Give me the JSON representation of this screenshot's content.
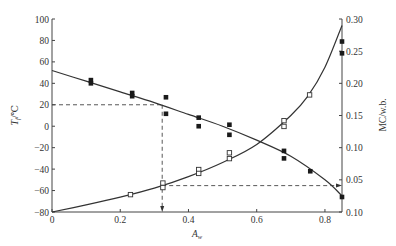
{
  "chart_data": {
    "type": "scatter",
    "title": "",
    "xlabel": "A_w",
    "ylabel_left": "T_f/℃",
    "ylabel_right": "MC/w.b.",
    "xlim": [
      0,
      0.85
    ],
    "ylim_left": [
      -80,
      100
    ],
    "ylim_right": [
      0.0,
      0.3
    ],
    "x_ticks": [
      "0",
      "0.2",
      "0.4",
      "0.6",
      "0.8"
    ],
    "x_tick_values": [
      0,
      0.2,
      0.4,
      0.6,
      0.8
    ],
    "y_left_ticks": [
      "100",
      "80",
      "60",
      "40",
      "20",
      "0",
      "-20",
      "-40",
      "-60",
      "-80"
    ],
    "y_left_tick_values": [
      100,
      80,
      60,
      40,
      20,
      0,
      -20,
      -40,
      -60,
      -80
    ],
    "y_right_ticks": [
      "0.30",
      "0.25",
      "0.20",
      "0.15",
      "0.10",
      "0.05",
      "0.10"
    ],
    "y_right_tick_values": [
      0.3,
      0.25,
      0.2,
      0.15,
      0.1,
      0.05,
      0.0
    ],
    "grid": false,
    "legend": null,
    "series": [
      {
        "name": "T_f (freezing point, filled squares)",
        "axis": "left",
        "marker": "filled-square",
        "points": [
          [
            0.114,
            43
          ],
          [
            0.114,
            40
          ],
          [
            0.235,
            31
          ],
          [
            0.235,
            28
          ],
          [
            0.334,
            27
          ],
          [
            0.334,
            11.6
          ],
          [
            0.43,
            8
          ],
          [
            0.43,
            0
          ],
          [
            0.52,
            1.4
          ],
          [
            0.52,
            -8
          ],
          [
            0.68,
            -23
          ],
          [
            0.68,
            -30
          ],
          [
            0.757,
            -42
          ],
          [
            0.85,
            -66
          ],
          [
            0.85,
            79
          ],
          [
            0.85,
            68
          ]
        ]
      },
      {
        "name": "MC (moisture content, open squares)",
        "axis": "right",
        "marker": "open-square",
        "points": [
          [
            0.23,
            0.027
          ],
          [
            0.325,
            0.045
          ],
          [
            0.325,
            0.038
          ],
          [
            0.43,
            0.066
          ],
          [
            0.43,
            0.06
          ],
          [
            0.52,
            0.092
          ],
          [
            0.52,
            0.083
          ],
          [
            0.68,
            0.142
          ],
          [
            0.68,
            0.133
          ],
          [
            0.755,
            0.182
          ]
        ]
      },
      {
        "name": "T_f fit curve",
        "axis": "left",
        "type": "line",
        "x": [
          0,
          0.1,
          0.2,
          0.3,
          0.4,
          0.5,
          0.6,
          0.7,
          0.8,
          0.85
        ],
        "values": [
          52,
          42,
          32,
          22,
          11,
          0,
          -13,
          -28,
          -50,
          -65
        ]
      },
      {
        "name": "MC fit curve",
        "axis": "right",
        "type": "line",
        "x": [
          0,
          0.1,
          0.2,
          0.3,
          0.4,
          0.5,
          0.6,
          0.7,
          0.75,
          0.8,
          0.85
        ],
        "values": [
          0.0,
          0.011,
          0.023,
          0.037,
          0.055,
          0.077,
          0.105,
          0.15,
          0.18,
          0.225,
          0.29
        ]
      }
    ],
    "annotations": [
      {
        "type": "dashed-horizontal",
        "axis": "left",
        "y": 20,
        "x_from": 0,
        "x_to": 0.323
      },
      {
        "type": "dashed-vertical-arrow",
        "x": 0.323,
        "y_from": 20,
        "y_to": -80,
        "direction": "down"
      },
      {
        "type": "dashed-horizontal-arrow",
        "axis": "right",
        "y": 0.041,
        "x_from": 0.323,
        "x_to": 0.85,
        "direction": "right"
      }
    ]
  }
}
